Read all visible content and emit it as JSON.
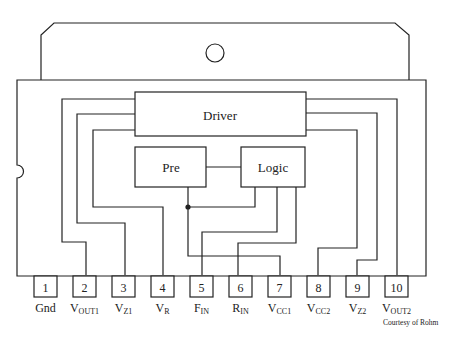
{
  "diagram": {
    "type": "IC package pinout block diagram",
    "blocks": [
      {
        "id": "driver",
        "label": "Driver"
      },
      {
        "id": "pre",
        "label": "Pre"
      },
      {
        "id": "logic",
        "label": "Logic"
      }
    ],
    "pins": [
      {
        "number": "1",
        "name": "Gnd",
        "sub": ""
      },
      {
        "number": "2",
        "name": "V",
        "sub": "OUT1"
      },
      {
        "number": "3",
        "name": "V",
        "sub": "Z1"
      },
      {
        "number": "4",
        "name": "V",
        "sub": "R"
      },
      {
        "number": "5",
        "name": "F",
        "sub": "IN"
      },
      {
        "number": "6",
        "name": "R",
        "sub": "IN"
      },
      {
        "number": "7",
        "name": "V",
        "sub": "CC1"
      },
      {
        "number": "8",
        "name": "V",
        "sub": "CC2"
      },
      {
        "number": "9",
        "name": "V",
        "sub": "Z2"
      },
      {
        "number": "10",
        "name": "V",
        "sub": "OUT2"
      }
    ],
    "credit": "Courtesy of Rohm"
  }
}
